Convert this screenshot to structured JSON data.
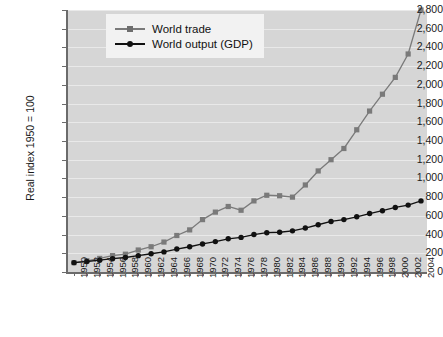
{
  "chart_data": {
    "type": "line",
    "title": "",
    "xlabel": "",
    "ylabel": "Real index 1950 = 100",
    "ylim": [
      0,
      2800
    ],
    "ytick_step": 200,
    "grid": true,
    "legend_position": "top-left-inside",
    "background": "#d6d6d6",
    "ytick_labels": [
      "2,800",
      "2,600",
      "2,400",
      "2,200",
      "2,000",
      "1,800",
      "1,600",
      "1,400",
      "1,200",
      "1,000",
      "800",
      "600",
      "400",
      "200",
      "0"
    ],
    "ytick_values": [
      2800,
      2600,
      2400,
      2200,
      2000,
      1800,
      1600,
      1400,
      1200,
      1000,
      800,
      600,
      400,
      200,
      0
    ],
    "categories": [
      1950,
      1952,
      1954,
      1956,
      1958,
      1960,
      1962,
      1964,
      1966,
      1968,
      1970,
      1972,
      1974,
      1976,
      1978,
      1980,
      1982,
      1984,
      1986,
      1988,
      1990,
      1992,
      1994,
      1996,
      1998,
      2000,
      2002,
      2004
    ],
    "xtick_labels": [
      "1950",
      "1952",
      "1954",
      "1956",
      "1958",
      "1960",
      "1962",
      "1964",
      "1966",
      "1968",
      "1970",
      "1972",
      "1974",
      "1976",
      "1978",
      "1980",
      "1982",
      "1984",
      "1986",
      "1988",
      "1990",
      "1992",
      "1994",
      "1996",
      "1998",
      "2000",
      "2002",
      "2004"
    ],
    "series": [
      {
        "name": "World trade",
        "color": "#7a7a7a",
        "marker": "square",
        "values": [
          100,
          120,
          145,
          175,
          190,
          235,
          270,
          320,
          390,
          450,
          560,
          640,
          700,
          660,
          760,
          820,
          815,
          800,
          930,
          1080,
          1200,
          1320,
          1520,
          1720,
          1900,
          2080,
          2330,
          2320
        ]
      },
      {
        "name": "World output (GDP)",
        "color": "#111111",
        "marker": "circle",
        "values": [
          100,
          112,
          126,
          142,
          155,
          175,
          195,
          215,
          245,
          270,
          300,
          325,
          355,
          370,
          400,
          420,
          425,
          440,
          470,
          505,
          540,
          560,
          590,
          625,
          655,
          690,
          715,
          745
        ]
      }
    ],
    "series_extra_points": {
      "World trade": [
        {
          "x": 2004,
          "y": 2800
        },
        {
          "x": 2003,
          "y": 2560
        }
      ],
      "World output (GDP)": [
        {
          "x": 2004,
          "y": 760
        }
      ]
    },
    "annotations": []
  },
  "legend": {
    "items": [
      {
        "label": "World trade"
      },
      {
        "label": "World output (GDP)"
      }
    ]
  }
}
